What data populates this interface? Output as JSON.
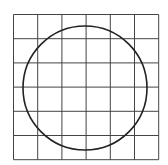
{
  "diagram": {
    "type": "grid-with-circle",
    "grid": {
      "rows": 6,
      "cols": 6,
      "x0": 13.5,
      "y0": 14.5,
      "cell": 24.2,
      "stroke": "#444444"
    },
    "circle": {
      "cx": 85,
      "cy": 88,
      "r": 62,
      "stroke": "#222222"
    },
    "background": "#ffffff"
  }
}
